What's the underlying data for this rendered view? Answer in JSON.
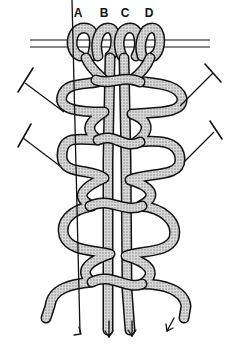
{
  "diagram": {
    "title": "",
    "cord_labels": [
      "A",
      "B",
      "C",
      "D"
    ],
    "elements": {
      "holding_bar": "double horizontal line at top with four mounted cords",
      "pins": 4,
      "loops_left": 4,
      "loops_right": 4,
      "direction_arrows": 4
    },
    "colors": {
      "ink": "#111111",
      "cord_fill": "#bdbdbd",
      "background": "#ffffff"
    }
  }
}
